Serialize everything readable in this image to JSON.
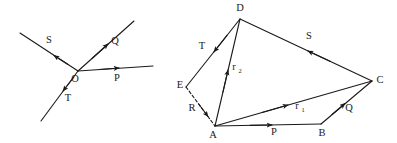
{
  "figure": {
    "background_color": "#ffffff",
    "ink_color": "#1a1a1a",
    "panels": [
      {
        "id": "concurrent-vectors",
        "name": "left-diagram",
        "description": "Four vectors drawn from a common origin point O",
        "origin_label": "O",
        "vector_labels": [
          "S",
          "Q",
          "P",
          "T"
        ]
      },
      {
        "id": "polygon-vectors",
        "name": "right-diagram",
        "description": "Closed vector polygon with vertices A B C D E and resultant vectors",
        "vertex_labels": [
          "D",
          "C",
          "B",
          "A",
          "E",
          "R"
        ],
        "vector_labels": [
          "T",
          "S",
          "P",
          "Q",
          "R"
        ],
        "resultant_labels": [
          "r",
          "r"
        ],
        "resultant_subscripts": [
          "1",
          "2"
        ]
      }
    ]
  },
  "left": {
    "origin": "O",
    "label_s": "S",
    "label_q": "Q",
    "label_p": "P",
    "label_t": "T"
  },
  "right": {
    "vertex_d": "D",
    "vertex_c": "C",
    "vertex_b": "B",
    "vertex_a": "A",
    "vertex_e": "E",
    "vertex_r": "R",
    "label_t": "T",
    "label_s": "S",
    "label_p": "P",
    "label_q": "Q",
    "label_r1_base": "r",
    "label_r1_sub": "1",
    "label_r2_base": "r",
    "label_r2_sub": "2"
  }
}
